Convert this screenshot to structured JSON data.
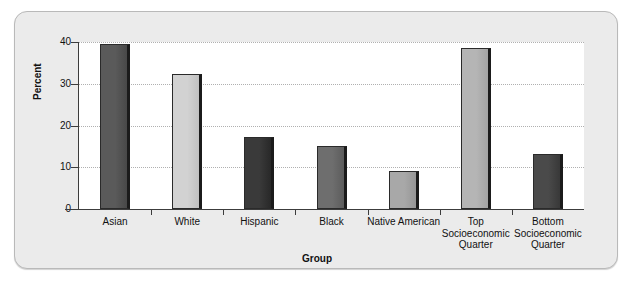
{
  "frame": {
    "background_color": "#ebebeb",
    "border_color": "#b9b9b9",
    "plot_background_color": "#ffffff"
  },
  "chart_data": {
    "type": "bar",
    "title": "",
    "xlabel": "Group",
    "ylabel": "Percent",
    "ylim": [
      0,
      40
    ],
    "yticks": [
      0,
      10,
      20,
      30,
      40
    ],
    "ytick_labels": [
      "0",
      "10",
      "20",
      "30",
      "40"
    ],
    "grid": true,
    "grid_style": "dotted",
    "legend": "none",
    "categories": [
      "Asian",
      "White",
      "Hispanic",
      "Black",
      "Native American",
      "Top Socioeconomic Quarter",
      "Bottom Socioeconomic Quarter"
    ],
    "category_label_lines": [
      [
        "Asian"
      ],
      [
        "White"
      ],
      [
        "Hispanic"
      ],
      [
        "Black"
      ],
      [
        "Native American"
      ],
      [
        "Top",
        "Socioeconomic",
        "Quarter"
      ],
      [
        "Bottom",
        "Socioeconomic",
        "Quarter"
      ]
    ],
    "values": [
      39.5,
      32.4,
      17.2,
      15.1,
      9.2,
      38.6,
      13.1
    ],
    "bar_colors": [
      "#5a5a5a",
      "#d2d2d2",
      "#3a3a3a",
      "#6e6e6e",
      "#a8a8a8",
      "#b5b5b5",
      "#4a4a4a"
    ],
    "bar_edge_color": "#2a2a2a",
    "bar_shadow_color": "#1b1b1b"
  }
}
